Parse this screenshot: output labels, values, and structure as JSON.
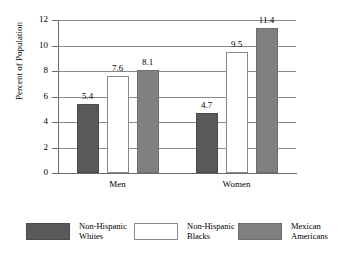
{
  "chart_data": {
    "type": "bar",
    "title": "",
    "xlabel": "",
    "ylabel": "Percent of Population",
    "categories": [
      "Men",
      "Women"
    ],
    "ylim": [
      0,
      12
    ],
    "yticks": [
      0,
      2,
      4,
      6,
      8,
      10,
      12
    ],
    "ytick_labels": [
      "0",
      "2",
      "4",
      "6",
      "8",
      "10",
      "12"
    ],
    "grid": true,
    "legend_position": "bottom",
    "series": [
      {
        "name": "Non-Hispanic Whites",
        "name_line1": "Non-Hispanic",
        "name_line2": "Whites",
        "color": "#595959",
        "values": [
          5.4,
          4.7
        ],
        "labels": [
          "5.4",
          "4.7"
        ]
      },
      {
        "name": "Non-Hispanic Blacks",
        "name_line1": "Non-Hispanic",
        "name_line2": "Blacks",
        "color": "#ffffff",
        "values": [
          7.6,
          9.5
        ],
        "labels": [
          "7.6",
          "9.5"
        ]
      },
      {
        "name": "Mexican Americans",
        "name_line1": "Mexican",
        "name_line2": "Americans",
        "color": "#808080",
        "values": [
          8.1,
          11.4
        ],
        "labels": [
          "8.1",
          "11.4"
        ]
      }
    ]
  }
}
